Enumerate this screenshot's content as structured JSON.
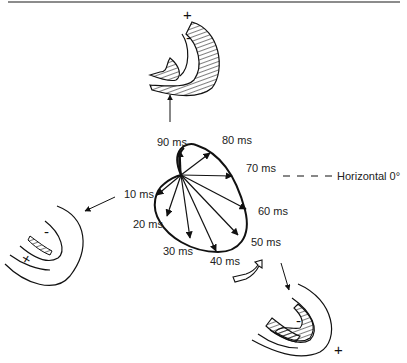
{
  "reference_axis": {
    "label": "Horizontal 0°"
  },
  "time_labels": [
    {
      "id": "10",
      "text": "10 ms"
    },
    {
      "id": "20",
      "text": "20 ms"
    },
    {
      "id": "30",
      "text": "30 ms"
    },
    {
      "id": "40",
      "text": "40 ms"
    },
    {
      "id": "50",
      "text": "50 ms"
    },
    {
      "id": "60",
      "text": "60 ms"
    },
    {
      "id": "70",
      "text": "70 ms"
    },
    {
      "id": "80",
      "text": "80 ms"
    },
    {
      "id": "90",
      "text": "90 ms"
    }
  ],
  "hearts": {
    "top": {
      "plus": "+",
      "minus": "-",
      "linked_time": "90 ms"
    },
    "left": {
      "plus": "+",
      "minus": "-",
      "linked_time": "10 ms"
    },
    "bottom": {
      "plus": "+",
      "minus": "-",
      "linked_time": "50 ms"
    }
  },
  "rotation": "clockwise"
}
